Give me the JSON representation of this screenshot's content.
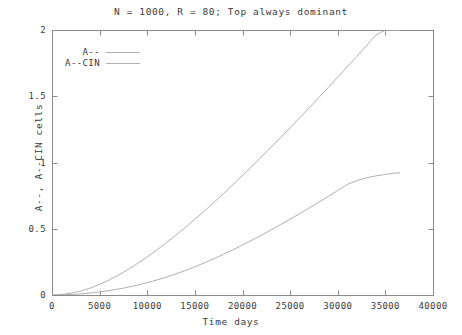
{
  "chart_data": {
    "type": "line",
    "title": "N = 1000, R = 80; Top always dominant",
    "xlabel": "Time days",
    "ylabel": "A--, A--CIN cells",
    "xlim": [
      0,
      40000
    ],
    "ylim": [
      0,
      2
    ],
    "grid": false,
    "legend_position": "top-left",
    "xticks": [
      0,
      5000,
      10000,
      15000,
      20000,
      25000,
      30000,
      35000,
      40000
    ],
    "xtick_labels": [
      "0",
      "5000",
      "10000",
      "15000",
      "20000",
      "25000",
      "30000",
      "35000",
      "40000"
    ],
    "yticks": [
      0,
      0.5,
      1,
      1.5,
      2
    ],
    "ytick_labels": [
      "0",
      "0.5",
      "1",
      "1.5",
      "2"
    ],
    "line_color": "#b0b0b0",
    "axis_color": "#8a8a8a",
    "text_color": "#3a3a3a",
    "series": [
      {
        "name": "A--",
        "color": "#b0b0b0",
        "x": [
          0,
          1000,
          2000,
          3000,
          4000,
          5000,
          6000,
          7000,
          8000,
          9000,
          10000,
          11000,
          12000,
          13000,
          14000,
          15000,
          16000,
          17000,
          18000,
          19000,
          20000,
          21000,
          22000,
          23000,
          24000,
          25000,
          26000,
          27000,
          28000,
          29000,
          30000,
          31000,
          32000,
          33000,
          34000,
          35000,
          36000,
          36500
        ],
        "y": [
          0.0,
          0.004,
          0.014,
          0.03,
          0.052,
          0.08,
          0.113,
          0.151,
          0.193,
          0.239,
          0.288,
          0.34,
          0.394,
          0.451,
          0.51,
          0.571,
          0.634,
          0.699,
          0.765,
          0.833,
          0.902,
          0.972,
          1.043,
          1.115,
          1.188,
          1.262,
          1.337,
          1.413,
          1.489,
          1.566,
          1.644,
          1.722,
          1.801,
          1.881,
          1.961,
          2.0,
          2.0,
          2.0
        ]
      },
      {
        "name": "A--CIN",
        "color": "#b0b0b0",
        "x": [
          0,
          1000,
          2000,
          3000,
          4000,
          5000,
          6000,
          7000,
          8000,
          9000,
          10000,
          11000,
          12000,
          13000,
          14000,
          15000,
          16000,
          17000,
          18000,
          19000,
          20000,
          21000,
          22000,
          23000,
          24000,
          25000,
          26000,
          27000,
          28000,
          29000,
          30000,
          31000,
          32000,
          33000,
          34000,
          35000,
          36000,
          36500
        ],
        "y": [
          0.0,
          0.001,
          0.004,
          0.008,
          0.015,
          0.023,
          0.033,
          0.045,
          0.059,
          0.075,
          0.093,
          0.113,
          0.135,
          0.159,
          0.185,
          0.213,
          0.243,
          0.274,
          0.307,
          0.341,
          0.377,
          0.414,
          0.452,
          0.491,
          0.531,
          0.572,
          0.614,
          0.657,
          0.7,
          0.744,
          0.789,
          0.834,
          0.864,
          0.884,
          0.899,
          0.91,
          0.92,
          0.922
        ]
      }
    ]
  },
  "legend": {
    "items": [
      {
        "label": "A--"
      },
      {
        "label": "A--CIN"
      }
    ]
  }
}
